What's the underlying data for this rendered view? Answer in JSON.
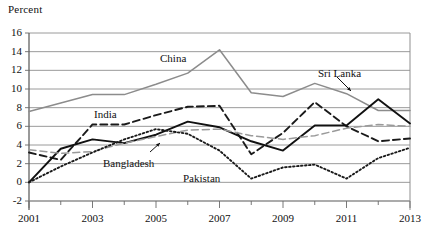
{
  "chart_data": {
    "type": "line",
    "title": "",
    "ylabel": "Percent",
    "xlabel": "",
    "ylim": [
      -2,
      16
    ],
    "xlim": [
      2001,
      2013
    ],
    "yticks": [
      16,
      14,
      12,
      10,
      8,
      6,
      4,
      2,
      0,
      -2
    ],
    "xticks": [
      2001,
      2003,
      2005,
      2007,
      2009,
      2011,
      2013
    ],
    "x": [
      2001,
      2002,
      2003,
      2004,
      2005,
      2006,
      2007,
      2008,
      2009,
      2010,
      2011,
      2012,
      2013
    ],
    "grid": true,
    "legend_position": "inline-annotations",
    "series": [
      {
        "name": "China",
        "style": "solid-gray",
        "color": "#8c8c8c",
        "values": [
          7.6,
          8.5,
          9.4,
          9.4,
          10.5,
          11.7,
          14.2,
          9.6,
          9.2,
          10.6,
          9.5,
          7.7,
          7.7
        ]
      },
      {
        "name": "India",
        "style": "dashed-black",
        "color": "#1a1a1a",
        "values": [
          3.2,
          2.4,
          6.2,
          6.2,
          7.2,
          8.1,
          8.2,
          3.0,
          5.3,
          8.6,
          6.0,
          4.4,
          4.7
        ]
      },
      {
        "name": "Sri Lanka",
        "style": "solid-black",
        "color": "#111111",
        "values": [
          0.0,
          3.6,
          4.6,
          4.2,
          5.1,
          6.5,
          5.9,
          4.4,
          3.4,
          6.1,
          6.1,
          8.9,
          6.3
        ]
      },
      {
        "name": "Bangladesh",
        "style": "dashed-gray",
        "color": "#9a9a9a",
        "values": [
          3.5,
          3.1,
          3.3,
          4.2,
          4.9,
          5.6,
          5.7,
          5.0,
          4.6,
          5.0,
          5.8,
          6.2,
          6.0
        ]
      },
      {
        "name": "Pakistan",
        "style": "dotted-black",
        "color": "#1a1a1a",
        "values": [
          0.0,
          1.7,
          3.2,
          4.6,
          5.7,
          5.2,
          3.4,
          0.4,
          1.6,
          1.9,
          0.4,
          2.6,
          3.7
        ]
      }
    ]
  },
  "annotations": [
    {
      "name": "china-label",
      "text": "China",
      "x": 160,
      "y": 52,
      "arrow": false
    },
    {
      "name": "india-label",
      "text": "India",
      "x": 94,
      "y": 108,
      "arrow": false
    },
    {
      "name": "bangladesh-label",
      "text": "Bangladesh",
      "x": 103,
      "y": 157,
      "arrow": true
    },
    {
      "name": "pakistan-label",
      "text": "Pakistan",
      "x": 183,
      "y": 172,
      "arrow": false
    },
    {
      "name": "srilanka-label",
      "text": "Sri Lanka",
      "x": 318,
      "y": 67,
      "arrow": true
    }
  ]
}
